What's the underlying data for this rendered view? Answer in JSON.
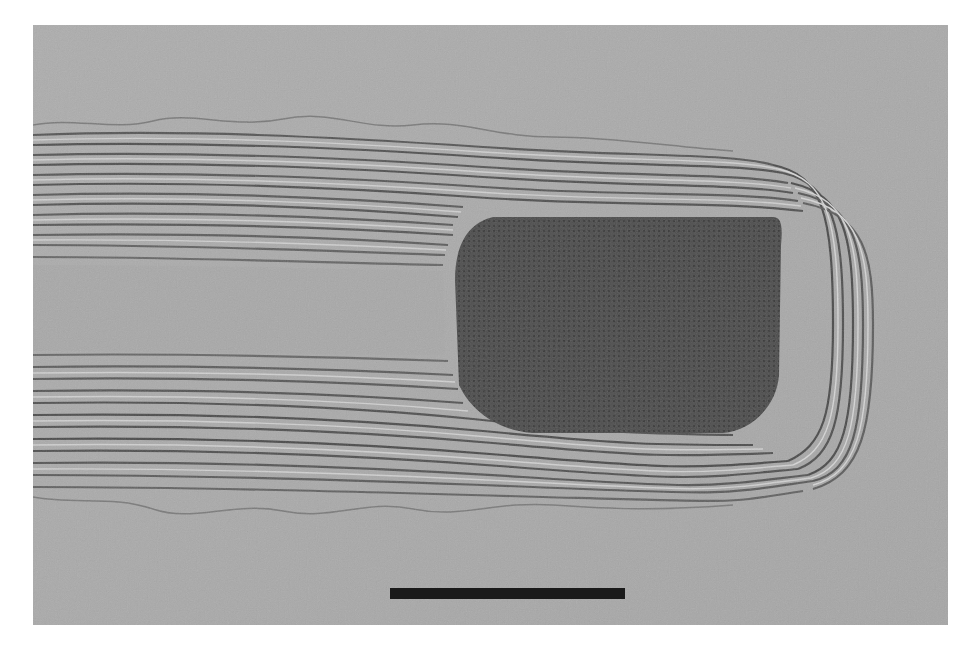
{
  "figure": {
    "type": "TEM micrograph",
    "colors": {
      "background": "#a9a9a9",
      "fringe_dark": "#4a4a4a",
      "fringe_light": "#d2d2d2",
      "particle": "#464646",
      "scale_bar": "#1a1a1a",
      "page": "#ffffff"
    },
    "scale_bar": {
      "label": "",
      "x": 390,
      "y": 588,
      "width": 235,
      "height": 11
    }
  }
}
